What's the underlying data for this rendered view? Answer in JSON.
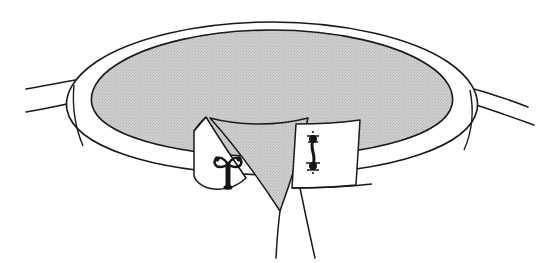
{
  "figure": {
    "title": "Line-art cut-away illustration of a shaded ellipsoidal disc within an open rim",
    "background_color": "#ffffff",
    "stroke_color": "#1a1a1a",
    "fill_shaded": "#c9c9c9",
    "fill_white": "#ffffff",
    "width": 546,
    "height": 263
  },
  "parts": {
    "outer_rim": {
      "label": "outer-rim-band",
      "description": "White elliptical band surrounding the shaded disc"
    },
    "shaded_disc": {
      "label": "shaded-disc",
      "description": "Large stippled grey ellipse occupying the upper centre"
    },
    "funnel": {
      "label": "central-funnel",
      "description": "Grey tapering wedge descending from the disc to a point below"
    },
    "left_tube": {
      "label": "left-tube",
      "description": "Pair of parallel lines entering from the left edge"
    },
    "right_tube": {
      "label": "right-tube",
      "description": "Pair of parallel lines leaving toward the right edge"
    },
    "left_panel": {
      "label": "left-cutaway-panel",
      "description": "White quadrilateral flap at lower-left of the funnel"
    },
    "right_panel": {
      "label": "right-cutaway-panel",
      "description": "White quadrilateral flap at lower-right of the funnel"
    },
    "stalk_lines": {
      "label": "descending-stalk-lines",
      "description": "Two thin lines descending from the base toward the bottom edge"
    }
  },
  "detail_figures": [
    {
      "id": "left-detail-figure",
      "name": "anchor-shaped-detail",
      "x": 228,
      "y": 168,
      "description": "Small dark anchor-like figure with two lobed arms and a straight shaft"
    },
    {
      "id": "right-detail-figure",
      "name": "dumbbell-shaped-detail",
      "x": 313,
      "y": 152,
      "description": "Small dark dumbbell-like figure with knobbed ends joined by a waisted stem"
    }
  ]
}
